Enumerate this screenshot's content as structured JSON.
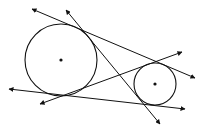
{
  "diagram": {
    "colors": {
      "stroke": "#111111",
      "background": "#ffffff"
    },
    "circles": [
      {
        "name": "large-circle",
        "cx": 61,
        "cy": 60,
        "r": 36
      },
      {
        "name": "small-circle",
        "cx": 155,
        "cy": 84,
        "r": 21
      }
    ],
    "lines": [
      {
        "name": "external-tangent-top",
        "x1": 32,
        "y1": 9,
        "x2": 195,
        "y2": 78
      },
      {
        "name": "internal-tangent-1",
        "x1": 66,
        "y1": 10,
        "x2": 160,
        "y2": 124
      },
      {
        "name": "internal-tangent-2",
        "x1": 40,
        "y1": 104,
        "x2": 182,
        "y2": 52
      },
      {
        "name": "external-tangent-bottom",
        "x1": 9,
        "y1": 89,
        "x2": 185,
        "y2": 109
      }
    ]
  }
}
